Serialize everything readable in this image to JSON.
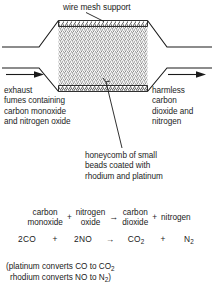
{
  "diagram": {
    "labels": {
      "top": "wire mesh support",
      "inlet": "exhaust\nfumes containing\ncarbon monoxide\nand nitrogen oxide",
      "outlet": "harmless\ncarbon\ndioxide and\nnitrogen",
      "core": "honeycomb of small\nbeads coated with\nrhodium and platinum"
    },
    "colors": {
      "stroke": "#1a1a1a",
      "bead_fill": "#d8d8d8",
      "mesh_fill": "#ffffff",
      "background": "#ffffff"
    }
  },
  "equation": {
    "words": {
      "reactant_1": "carbon\nmonoxide",
      "plus_1": "+",
      "reactant_2": "nitrogen\noxide",
      "arrow": "→",
      "product_1": "carbon\ndioxide",
      "plus_2": "+",
      "product_2": "nitrogen"
    },
    "symbols": {
      "reactant_1": "2CO",
      "plus_1": "+",
      "reactant_2": "2NO",
      "arrow": "→",
      "product_1_base": "CO",
      "product_1_sub": "2",
      "plus_2": "+",
      "product_2_base": "N",
      "product_2_sub": "2"
    }
  },
  "note": {
    "line_1_pre": "(platinum converts CO to CO",
    "line_1_sub": "2",
    "line_2_pre": "rhodium converts NO to N",
    "line_2_sub": "2",
    "line_2_post": ")"
  }
}
